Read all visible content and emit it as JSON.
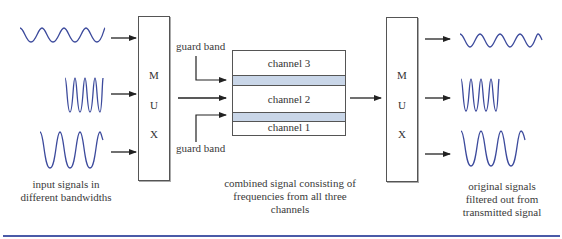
{
  "mux_left": {
    "letters": [
      "M",
      "U",
      "X"
    ]
  },
  "mux_right": {
    "letters": [
      "M",
      "U",
      "X"
    ]
  },
  "combined_band": {
    "channels": [
      "channel 3",
      "channel 2",
      "channel 1"
    ]
  },
  "labels": {
    "guard_band_top": "guard band",
    "guard_band_bottom": "guard band",
    "input_caption_line1": "input signals in",
    "input_caption_line2": "different bandwidths",
    "combined_caption_line1": "combined signal consisting of",
    "combined_caption_line2": "frequencies from all three",
    "combined_caption_line3": "channels",
    "output_caption_line1": "original signals",
    "output_caption_line2": "filtered out from",
    "output_caption_line3": "transmitted signal"
  },
  "colors": {
    "wave": "#3c4a9c",
    "guard_fill": "#c9d6e8",
    "rule": "#4a5aa8"
  }
}
